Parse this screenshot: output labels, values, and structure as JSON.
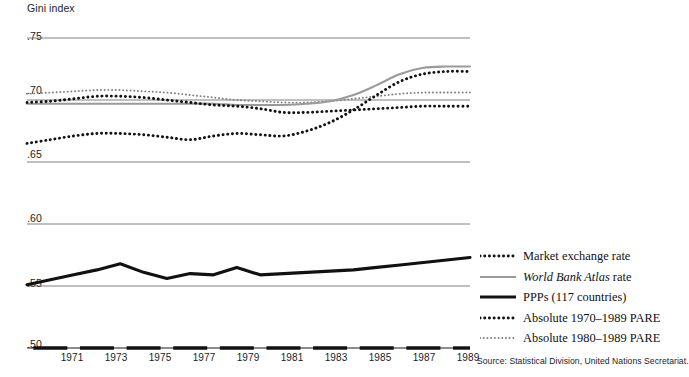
{
  "chart_data": {
    "type": "line",
    "title": "Gini index",
    "xlabel": "",
    "ylabel": "Gini index",
    "ylim": [
      0.5,
      0.75
    ],
    "xlim": [
      1970,
      1990
    ],
    "grid": true,
    "y_ticks": [
      ".75",
      ".70",
      ".65",
      ".60",
      ".55",
      ".50"
    ],
    "y_tick_values": [
      0.75,
      0.7,
      0.65,
      0.6,
      0.55,
      0.5
    ],
    "x_ticks": [
      "1971",
      "1973",
      "1975",
      "1977",
      "1979",
      "1981",
      "1983",
      "1985",
      "1987",
      "1989"
    ],
    "x_tick_values": [
      1971,
      1973,
      1975,
      1977,
      1979,
      1981,
      1983,
      1985,
      1987,
      1989
    ],
    "x_values": [
      1970,
      1971,
      1972,
      1973,
      1974,
      1975,
      1976,
      1977,
      1978,
      1979,
      1980,
      1981,
      1982,
      1983,
      1984,
      1985,
      1986,
      1987,
      1988,
      1989
    ],
    "legend_position": "right",
    "series": [
      {
        "name": "Market exchange rate",
        "style": "bold-dotted",
        "color": "#111111",
        "values": [
          0.698,
          0.699,
          0.701,
          0.703,
          0.703,
          0.702,
          0.7,
          0.698,
          0.696,
          0.695,
          0.693,
          0.69,
          0.69,
          0.691,
          0.692,
          0.693,
          0.694,
          0.695,
          0.695,
          0.695
        ]
      },
      {
        "name": "World Bank Atlas rate",
        "style": "solid-gray",
        "color": "#9a9a9a",
        "values": [
          0.697,
          0.697,
          0.697,
          0.697,
          0.697,
          0.697,
          0.697,
          0.697,
          0.697,
          0.696,
          0.696,
          0.696,
          0.697,
          0.699,
          0.704,
          0.712,
          0.721,
          0.726,
          0.727,
          0.727
        ]
      },
      {
        "name": "PPPs (117 countries)",
        "style": "solid-thick-black",
        "color": "#111111",
        "values": [
          0.551,
          0.555,
          0.559,
          0.563,
          0.568,
          0.561,
          0.556,
          0.56,
          0.559,
          0.565,
          0.559,
          0.56,
          0.561,
          0.562,
          0.563,
          0.565,
          0.567,
          0.569,
          0.571,
          0.573
        ]
      },
      {
        "name": "Absolute 1970–1989 PARE",
        "style": "bold-dotted",
        "color": "#111111",
        "values": [
          0.665,
          0.668,
          0.671,
          0.673,
          0.673,
          0.672,
          0.67,
          0.668,
          0.671,
          0.673,
          0.672,
          0.671,
          0.675,
          0.682,
          0.692,
          0.704,
          0.715,
          0.721,
          0.723,
          0.723
        ]
      },
      {
        "name": "Absolute 1980–1989 PARE",
        "style": "light-dotted",
        "color": "#808080",
        "values": [
          0.705,
          0.706,
          0.707,
          0.708,
          0.708,
          0.707,
          0.706,
          0.704,
          0.702,
          0.7,
          0.699,
          0.698,
          0.698,
          0.699,
          0.701,
          0.703,
          0.705,
          0.706,
          0.706,
          0.706
        ]
      }
    ]
  },
  "legend": {
    "items": [
      {
        "label": "Market exchange rate",
        "italic_part": "",
        "rest": ""
      },
      {
        "label": "World Bank Atlas rate",
        "italic_part": "World Bank Atlas",
        "rest": " rate"
      },
      {
        "label": "PPPs (117 countries)",
        "italic_part": "",
        "rest": ""
      },
      {
        "label": "Absolute 1970–1989 PARE",
        "italic_part": "",
        "rest": ""
      },
      {
        "label": "Absolute 1980–1989 PARE",
        "italic_part": "",
        "rest": ""
      }
    ]
  },
  "source": {
    "text": "Source: Statistical Division, United Nations Secretariat."
  },
  "colors": {
    "dark": "#111111",
    "gray_line": "#9a9a9a",
    "light_dots": "#808080",
    "gridline": "#606060",
    "axis": "#1a1a1a"
  }
}
